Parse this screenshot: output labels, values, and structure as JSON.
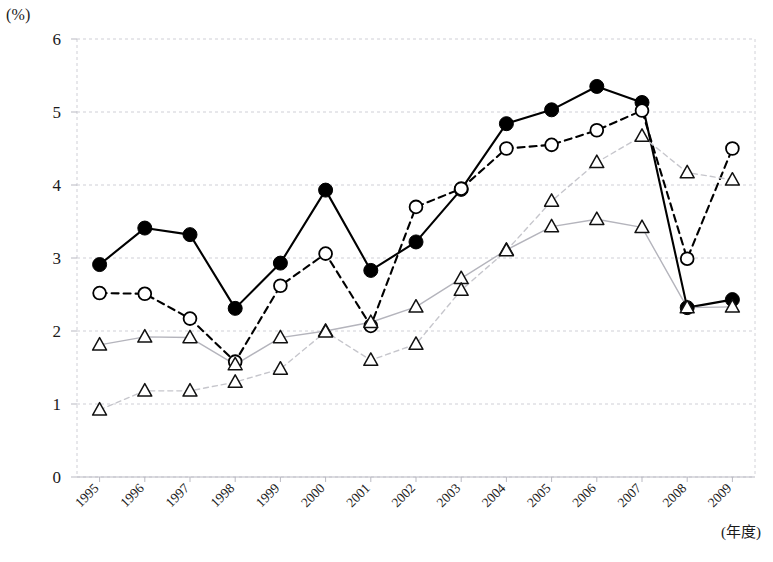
{
  "chart_data": {
    "type": "line",
    "title": "",
    "subtitle": "",
    "ylabel": "(%)",
    "xlabel": "(年度)",
    "ylim": [
      0,
      6
    ],
    "yticks": [
      0,
      1,
      2,
      3,
      4,
      5,
      6
    ],
    "grid": true,
    "legend_position": "none",
    "categories": [
      "1995",
      "1996",
      "1997",
      "1998",
      "1999",
      "2000",
      "2001",
      "2002",
      "2003",
      "2004",
      "2005",
      "2006",
      "2007",
      "2008",
      "2009"
    ],
    "series": [
      {
        "name": "series-filled-circle-solid",
        "marker": "filled-circle",
        "line_style": "solid",
        "color": "#000000",
        "values": [
          2.91,
          3.41,
          3.32,
          2.31,
          2.93,
          3.93,
          2.83,
          3.22,
          3.94,
          4.84,
          5.03,
          5.35,
          5.13,
          2.32,
          2.43
        ]
      },
      {
        "name": "series-open-circle-dashed",
        "marker": "open-circle",
        "line_style": "dashed",
        "color": "#000000",
        "values": [
          2.52,
          2.51,
          2.17,
          1.58,
          2.62,
          3.06,
          2.07,
          3.7,
          3.95,
          4.5,
          4.55,
          4.75,
          5.02,
          2.99,
          4.5
        ]
      },
      {
        "name": "series-triangle-solid",
        "marker": "open-triangle",
        "line_style": "solid",
        "color": "#b4b4bc",
        "values": [
          1.81,
          1.92,
          1.91,
          1.54,
          1.91,
          2.0,
          2.12,
          2.33,
          2.72,
          3.11,
          3.43,
          3.53,
          3.42,
          2.32,
          2.33
        ]
      },
      {
        "name": "series-triangle-dashed",
        "marker": "open-triangle",
        "line_style": "dashed",
        "color": "#c6c6cc",
        "values": [
          0.92,
          1.18,
          1.18,
          1.3,
          1.48,
          1.99,
          1.6,
          1.82,
          2.56,
          3.1,
          3.78,
          4.31,
          4.67,
          4.17,
          4.07
        ]
      }
    ]
  },
  "axis": {
    "unit_label": "(%)",
    "x_title": "(年度)"
  }
}
